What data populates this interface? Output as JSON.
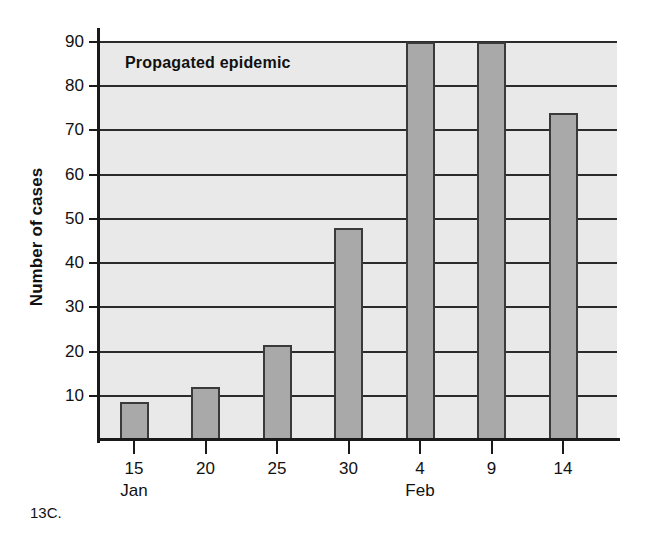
{
  "figure": {
    "caption": "13C."
  },
  "chart_data": {
    "type": "bar",
    "title": "Propagated epidemic",
    "xlabel": "",
    "ylabel": "Number of cases",
    "categories": [
      "15",
      "20",
      "25",
      "30",
      "4",
      "9",
      "14"
    ],
    "values": [
      8.5,
      12,
      21.5,
      48,
      90,
      90,
      74
    ],
    "month_labels": [
      {
        "category": "15",
        "label": "Jan"
      },
      {
        "category": "4",
        "label": "Feb"
      }
    ],
    "ylim": [
      0,
      90
    ],
    "yticks": [
      10,
      20,
      30,
      40,
      50,
      60,
      70,
      80,
      90
    ],
    "ytick_labels": [
      "10",
      "20",
      "30",
      "40",
      "50",
      "60",
      "70",
      "80",
      "90"
    ],
    "grid": true,
    "legend": "none",
    "colors": {
      "bar_fill": "#a9a9a9",
      "bar_outline": "#3a3a3a",
      "plot_background": "#e9e9e9",
      "gridline": "#2b2b2b",
      "axis": "#1a1a1a",
      "text": "#111111"
    }
  }
}
